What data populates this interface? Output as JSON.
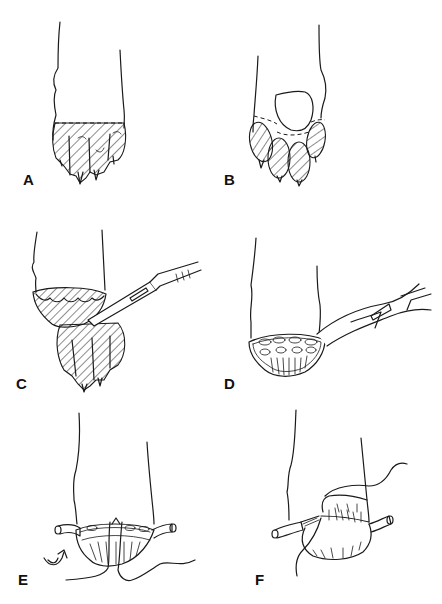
{
  "figure": {
    "panels": [
      {
        "id": "A",
        "label": "A",
        "description": "Paw with digital pads and claws hatched, dashed line indicating excision level"
      },
      {
        "id": "B",
        "label": "B",
        "description": "Paw with metacarpal pad and hatched digital pads, dashed outline"
      },
      {
        "id": "C",
        "label": "C",
        "description": "Scalpel transecting digits from paw"
      },
      {
        "id": "D",
        "label": "D",
        "description": "Forceps/clamp on vessel at transected paw stump"
      },
      {
        "id": "E",
        "label": "E",
        "description": "Vessel ends exposed with sutures placed, rotation arrow"
      },
      {
        "id": "F",
        "label": "F",
        "description": "Skin flap sutured closed over stump with suture thread"
      }
    ]
  },
  "colors": {
    "ink": "#1a1a1a",
    "background": "#ffffff"
  }
}
